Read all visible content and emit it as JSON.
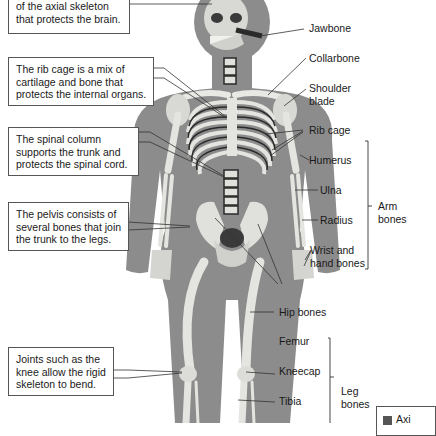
{
  "diagram": {
    "notes": [
      {
        "id": "skull",
        "lines": [
          "of the axial skeleton",
          "that protects the brain."
        ]
      },
      {
        "id": "ribcage",
        "lines": [
          "The rib cage is a mix of",
          "cartilage and bone that",
          "protects the internal organs."
        ]
      },
      {
        "id": "spine",
        "lines": [
          "The spinal column",
          "supports the trunk and",
          "protects the spinal cord."
        ]
      },
      {
        "id": "pelvis",
        "lines": [
          "The pelvis consists of",
          "several bones that join",
          "the trunk to the legs."
        ]
      },
      {
        "id": "joints",
        "lines": [
          "Joints such as the",
          "knee allow the rigid",
          "skeleton to bend."
        ]
      }
    ],
    "labels": {
      "jawbone": "Jawbone",
      "collarbone": "Collarbone",
      "shoulder_blade": [
        "Shoulder",
        "blade"
      ],
      "rib_cage": "Rib cage",
      "humerus": "Humerus",
      "ulna": "Ulna",
      "radius": "Radius",
      "wrist": [
        "Wrist and",
        "hand bones"
      ],
      "hip_bones": "Hip bones",
      "femur": "Femur",
      "kneecap": "Kneecap",
      "tibia": "Tibia"
    },
    "groups": {
      "arm": [
        "Arm",
        "bones"
      ],
      "leg": [
        "Leg",
        "bones"
      ]
    },
    "legend": {
      "swatch_label": "Axi",
      "swatch_color": "#555555"
    },
    "colors": {
      "body": "#8c8c8c",
      "bone": "#e4e4e0",
      "bone_shadow": "#b8b8b2",
      "dark": "#3a3a3a",
      "leader": "#333333"
    }
  }
}
